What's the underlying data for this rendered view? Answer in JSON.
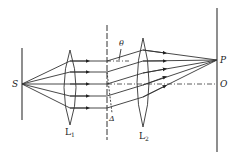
{
  "diagram": {
    "title": "",
    "type": "optics-grating-diffraction",
    "labels": {
      "source": "S",
      "lens1": "L",
      "lens1_sub": "1",
      "lens2": "L",
      "lens2_sub": "2",
      "angle": "θ",
      "path_difference": "Δ",
      "point_P": "P",
      "point_O": "O"
    },
    "colors": {
      "stroke": "#333333",
      "background": "#ffffff"
    }
  }
}
